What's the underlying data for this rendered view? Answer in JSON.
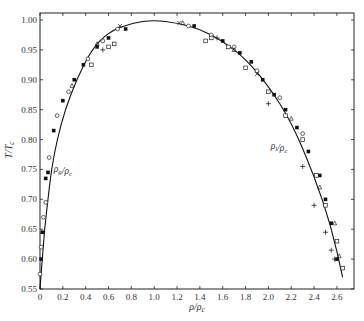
{
  "chart_data": {
    "type": "scatter",
    "title": "",
    "xlabel": "ρ/ρ_c",
    "ylabel": "T/T_c",
    "xlim": [
      0,
      2.75
    ],
    "ylim": [
      0.55,
      1.02
    ],
    "grid": false,
    "x_ticks": [
      "0",
      "0.2",
      "0.4",
      "0.6",
      "0.8",
      "1.0",
      "1.2",
      "1.4",
      "1.6",
      "1.8",
      "2.0",
      "2.2",
      "2.4",
      "2.6"
    ],
    "y_ticks": [
      "0.55",
      "0.60",
      "0.65",
      "0.70",
      "0.75",
      "0.80",
      "0.85",
      "0.90",
      "0.95",
      "1.00"
    ],
    "annotations": [
      {
        "text": "ρ_g/ρ_c",
        "x": 0.12,
        "y": 0.745
      },
      {
        "text": "ρ_l/ρ_c",
        "x": 2.02,
        "y": 0.785
      }
    ],
    "fit_curve": {
      "name": "coexistence curve",
      "points": [
        [
          0.0,
          0.55
        ],
        [
          0.02,
          0.6
        ],
        [
          0.04,
          0.65
        ],
        [
          0.07,
          0.7
        ],
        [
          0.1,
          0.75
        ],
        [
          0.15,
          0.8
        ],
        [
          0.22,
          0.85
        ],
        [
          0.32,
          0.9
        ],
        [
          0.45,
          0.95
        ],
        [
          0.6,
          0.98
        ],
        [
          0.8,
          0.995
        ],
        [
          1.0,
          1.0
        ],
        [
          1.2,
          0.995
        ],
        [
          1.4,
          0.985
        ],
        [
          1.6,
          0.965
        ],
        [
          1.8,
          0.935
        ],
        [
          2.0,
          0.89
        ],
        [
          2.2,
          0.83
        ],
        [
          2.4,
          0.74
        ],
        [
          2.55,
          0.655
        ],
        [
          2.65,
          0.57
        ]
      ]
    },
    "series": [
      {
        "name": "filled squares",
        "marker": "filled-square",
        "points": [
          [
            0.01,
            0.6
          ],
          [
            0.02,
            0.645
          ],
          [
            0.05,
            0.735
          ],
          [
            0.07,
            0.745
          ],
          [
            0.12,
            0.815
          ],
          [
            0.2,
            0.865
          ],
          [
            0.3,
            0.9
          ],
          [
            0.38,
            0.925
          ],
          [
            0.5,
            0.955
          ],
          [
            0.6,
            0.97
          ],
          [
            0.75,
            0.985
          ],
          [
            1.35,
            0.99
          ],
          [
            1.6,
            0.965
          ],
          [
            1.75,
            0.945
          ],
          [
            1.85,
            0.93
          ],
          [
            1.95,
            0.9
          ],
          [
            2.05,
            0.875
          ],
          [
            2.15,
            0.85
          ],
          [
            2.25,
            0.82
          ],
          [
            2.35,
            0.78
          ],
          [
            2.45,
            0.74
          ],
          [
            2.5,
            0.7
          ],
          [
            2.55,
            0.66
          ],
          [
            2.6,
            0.6
          ]
        ]
      },
      {
        "name": "open circles",
        "marker": "open-circle",
        "points": [
          [
            0.0,
            0.575
          ],
          [
            0.01,
            0.62
          ],
          [
            0.03,
            0.67
          ],
          [
            0.05,
            0.695
          ],
          [
            0.08,
            0.77
          ],
          [
            0.15,
            0.84
          ],
          [
            0.25,
            0.88
          ],
          [
            0.42,
            0.935
          ],
          [
            0.55,
            0.965
          ],
          [
            0.68,
            0.985
          ],
          [
            1.3,
            0.99
          ],
          [
            1.5,
            0.975
          ],
          [
            1.7,
            0.955
          ],
          [
            1.9,
            0.915
          ],
          [
            2.1,
            0.87
          ],
          [
            2.3,
            0.81
          ]
        ]
      },
      {
        "name": "open squares",
        "marker": "open-square",
        "points": [
          [
            0.45,
            0.925
          ],
          [
            0.6,
            0.955
          ],
          [
            0.65,
            0.96
          ],
          [
            1.45,
            0.965
          ],
          [
            1.5,
            0.97
          ],
          [
            1.65,
            0.955
          ],
          [
            1.8,
            0.92
          ],
          [
            2.0,
            0.88
          ],
          [
            2.15,
            0.84
          ],
          [
            2.3,
            0.8
          ],
          [
            2.42,
            0.74
          ],
          [
            2.5,
            0.69
          ],
          [
            2.6,
            0.63
          ],
          [
            2.65,
            0.585
          ]
        ]
      },
      {
        "name": "crosses",
        "marker": "plus",
        "points": [
          [
            0.55,
            0.95
          ],
          [
            1.55,
            0.97
          ],
          [
            2.0,
            0.86
          ],
          [
            2.3,
            0.755
          ],
          [
            2.4,
            0.69
          ],
          [
            2.5,
            0.645
          ],
          [
            2.55,
            0.615
          ],
          [
            2.58,
            0.6
          ]
        ]
      },
      {
        "name": "triangles",
        "marker": "triangle",
        "points": [
          [
            0.28,
            0.89
          ],
          [
            0.5,
            0.96
          ],
          [
            1.25,
            0.995
          ],
          [
            1.7,
            0.95
          ],
          [
            2.2,
            0.835
          ],
          [
            2.45,
            0.72
          ],
          [
            2.58,
            0.66
          ],
          [
            2.62,
            0.605
          ]
        ]
      },
      {
        "name": "x marks",
        "marker": "x",
        "points": [
          [
            0.7,
            0.99
          ],
          [
            1.22,
            0.995
          ],
          [
            1.9,
            0.91
          ]
        ]
      }
    ]
  },
  "axes": {
    "xlabel": "ρ/ρ_c",
    "ylabel": "T/T_c"
  }
}
